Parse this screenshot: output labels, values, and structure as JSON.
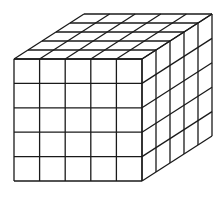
{
  "diagram": {
    "type": "cube-grid",
    "divisions": 5,
    "colors": {
      "line": "#1a1a1a",
      "fill": "#ffffff"
    },
    "front_face": {
      "x": 14,
      "y": 59,
      "width": 128,
      "height": 122
    },
    "depth_offset": {
      "dx": 70,
      "dy": -45
    }
  }
}
